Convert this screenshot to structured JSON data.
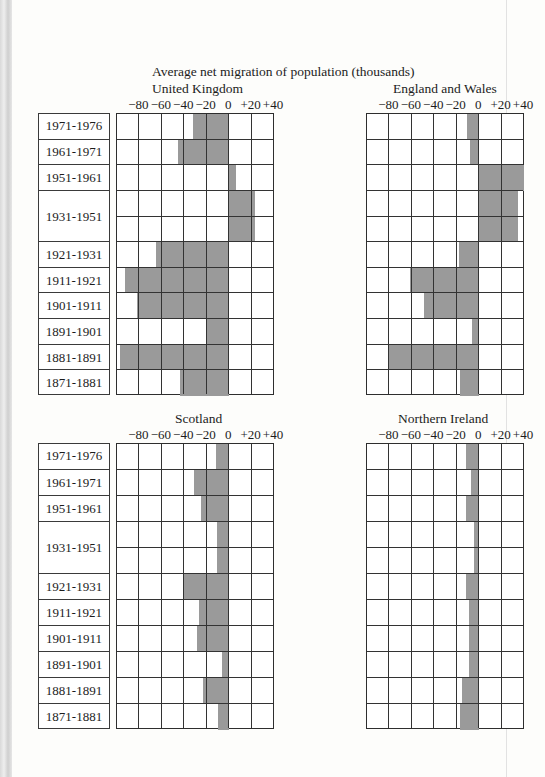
{
  "main_title": "Average net migration of population (thousands)",
  "axis": {
    "min": -100,
    "max": 40,
    "step": 20,
    "tick_values": [
      -80,
      -60,
      -40,
      -20,
      0,
      20,
      40
    ],
    "tick_labels": [
      "−80",
      "−60",
      "−40",
      "−20",
      "0",
      "+20",
      "+40"
    ]
  },
  "periods": [
    {
      "label": "1971-1976",
      "span": 1
    },
    {
      "label": "1961-1971",
      "span": 1
    },
    {
      "label": "1951-1961",
      "span": 1
    },
    {
      "label": "1931-1951",
      "span": 2
    },
    {
      "label": "1921-1931",
      "span": 1
    },
    {
      "label": "1911-1921",
      "span": 1
    },
    {
      "label": "1901-1911",
      "span": 1
    },
    {
      "label": "1891-1901",
      "span": 1
    },
    {
      "label": "1881-1891",
      "span": 1
    },
    {
      "label": "1871-1881",
      "span": 1
    }
  ],
  "colors": {
    "bar": "#9a9a9a",
    "grid": "#333333"
  },
  "chart_data": [
    {
      "type": "bar",
      "orientation": "horizontal",
      "title": "United Kingdom",
      "xlabel": "Average net migration of population (thousands)",
      "categories": [
        "1971-1976",
        "1961-1971",
        "1951-1961",
        "1931-1951",
        "1921-1931",
        "1911-1921",
        "1901-1911",
        "1891-1901",
        "1881-1891",
        "1871-1881"
      ],
      "values": [
        -32,
        -46,
        6,
        23,
        -65,
        -93,
        -82,
        -20,
        -97,
        -44
      ],
      "xlim": [
        -100,
        40
      ],
      "grid": true
    },
    {
      "type": "bar",
      "orientation": "horizontal",
      "title": "England and Wales",
      "xlabel": "Average net migration of population (thousands)",
      "categories": [
        "1971-1976",
        "1961-1971",
        "1951-1961",
        "1931-1951",
        "1921-1931",
        "1911-1921",
        "1901-1911",
        "1891-1901",
        "1881-1891",
        "1871-1881"
      ],
      "values": [
        -11,
        -8,
        40,
        35,
        -18,
        -62,
        -49,
        -6,
        -80,
        -17
      ],
      "xlim": [
        -100,
        40
      ],
      "grid": true
    },
    {
      "type": "bar",
      "orientation": "horizontal",
      "title": "Scotland",
      "xlabel": "Average net migration of population (thousands)",
      "categories": [
        "1971-1976",
        "1961-1971",
        "1951-1961",
        "1931-1951",
        "1921-1931",
        "1911-1921",
        "1901-1911",
        "1891-1901",
        "1881-1891",
        "1871-1881"
      ],
      "values": [
        -12,
        -31,
        -25,
        -11,
        -40,
        -27,
        -29,
        -6,
        -23,
        -10
      ],
      "xlim": [
        -100,
        40
      ],
      "grid": true
    },
    {
      "type": "bar",
      "orientation": "horizontal",
      "title": "Northern Ireland",
      "xlabel": "Average net migration of population (thousands)",
      "categories": [
        "1971-1976",
        "1961-1971",
        "1951-1961",
        "1931-1951",
        "1921-1931",
        "1911-1921",
        "1901-1911",
        "1891-1901",
        "1881-1891",
        "1871-1881"
      ],
      "values": [
        -12,
        -7,
        -12,
        -5,
        -12,
        -9,
        -9,
        -9,
        -15,
        -17
      ],
      "xlim": [
        -100,
        40
      ],
      "grid": true
    }
  ],
  "panels": [
    {
      "id": "uk",
      "title": "United Kingdom",
      "grid_left": 116,
      "grid_top": 113,
      "grid_height": 282,
      "title_left": 152,
      "title_top": 81,
      "axis_top": 97,
      "label_box": true
    },
    {
      "id": "ew",
      "title": "England and Wales",
      "grid_left": 366,
      "grid_top": 113,
      "grid_height": 282,
      "title_left": 393,
      "title_top": 81,
      "axis_top": 97,
      "label_box": false
    },
    {
      "id": "sc",
      "title": "Scotland",
      "grid_left": 116,
      "grid_top": 443,
      "grid_height": 286,
      "title_left": 175,
      "title_top": 411,
      "axis_top": 427,
      "label_box": true
    },
    {
      "id": "ni",
      "title": "Northern Ireland",
      "grid_left": 366,
      "grid_top": 443,
      "grid_height": 286,
      "title_left": 398,
      "title_top": 411,
      "axis_top": 427,
      "label_box": false
    }
  ]
}
